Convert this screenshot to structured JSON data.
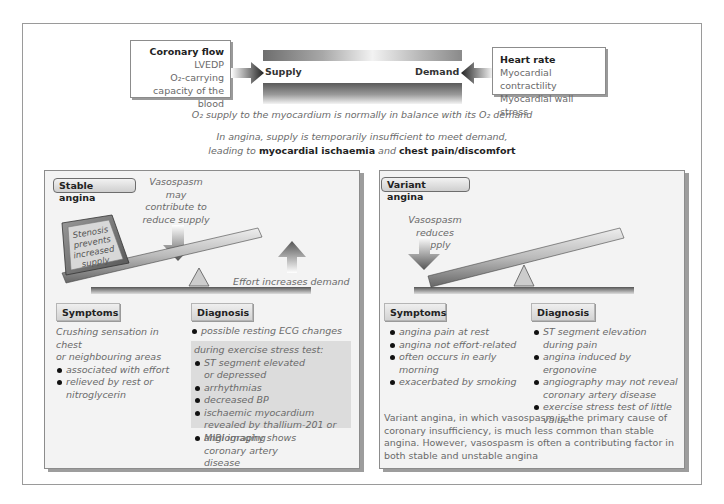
{
  "balance": {
    "supply_factors": {
      "primary": "Coronary flow",
      "items": [
        "LVEDP",
        "O₂-carrying capacity of the blood"
      ]
    },
    "demand_factors": {
      "primary": "Heart rate",
      "items": [
        "Myocardial contractility",
        "Myocardial wall stress"
      ]
    },
    "supply_label": "Supply",
    "demand_label": "Demand",
    "caption": "O₂ supply to the myocardium is normally in balance with its O₂ demand",
    "angina_line1": "In angina, supply is temporarily insufficient to meet demand,",
    "angina_line2_pre": "leading to ",
    "angina_term1": "myocardial ischaemia",
    "angina_mid": " and ",
    "angina_term2": "chest pain/discomfort"
  },
  "stable": {
    "title": "Stable angina",
    "vasospasm_note": [
      "Vasospasm may",
      "contribute to",
      "reduce supply"
    ],
    "stenosis_block": [
      "Stenosis",
      "prevents",
      "increased",
      "supply"
    ],
    "effort_note": "Effort increases demand",
    "symptoms": {
      "heading": "Symptoms",
      "intro": [
        "Crushing sensation in chest",
        "or neighbouring areas"
      ],
      "items": [
        "associated with effort",
        "relieved by rest or nitroglycerin"
      ]
    },
    "diagnosis": {
      "heading": "Diagnosis",
      "item_resting": "possible resting ECG changes",
      "stress_intro": "during exercise stress test:",
      "stress_items": [
        "ST segment elevated or depressed",
        "arrhythmias",
        "decreased BP",
        "ischaemic myocardium revealed by thallium-201 or MIBI imaging"
      ],
      "item_angio": "angiography shows coronary artery disease"
    }
  },
  "variant": {
    "title": "Variant angina",
    "vasospasm_note": [
      "Vasospasm reduces",
      "supply"
    ],
    "symptoms": {
      "heading": "Symptoms",
      "items": [
        "angina pain at rest",
        "angina not effort-related",
        "often occurs in early morning",
        "exacerbated by smoking"
      ]
    },
    "diagnosis": {
      "heading": "Diagnosis",
      "items": [
        "ST segment elevation during pain",
        "angina induced by ergonovine",
        "angiography may not reveal coronary artery disease",
        "exercise stress test of little value"
      ]
    },
    "footnote": "Variant angina, in which vasospasm is the primary cause of coronary insufficiency, is much less common than stable angina. However, vasospasm is often a contributing factor in both stable and unstable angina"
  },
  "colors": {
    "frame_border": "#9a9a9a",
    "panel_bg": "#f3f3f3",
    "shaded_bg": "#dcdcdc",
    "text_body": "#6a6a6a",
    "text_strong": "#222222"
  }
}
